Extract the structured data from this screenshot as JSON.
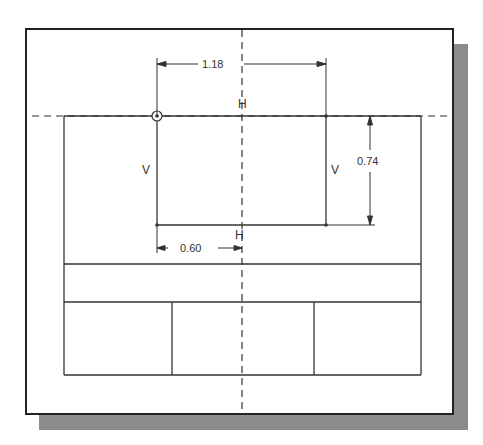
{
  "colors": {
    "line": "#333333",
    "frame": "#222222",
    "shadow": "#8c8c8c",
    "background": "#ffffff"
  },
  "sketch": {
    "dimensions": [
      {
        "id": "width",
        "value": "1.18",
        "orientation": "horizontal"
      },
      {
        "id": "height",
        "value": "0.74",
        "orientation": "vertical"
      },
      {
        "id": "offset",
        "value": "0.60",
        "orientation": "horizontal"
      }
    ],
    "constraints": [
      {
        "id": "top-horizontal",
        "symbol": "H"
      },
      {
        "id": "bottom-horizontal",
        "symbol": "H"
      },
      {
        "id": "left-vertical",
        "symbol": "V"
      },
      {
        "id": "right-vertical",
        "symbol": "V"
      }
    ],
    "centerlines": [
      "horizontal",
      "vertical"
    ],
    "origin_marker": "circle-origin"
  }
}
